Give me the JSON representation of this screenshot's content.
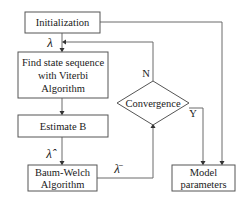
{
  "diagram": {
    "nodes": {
      "initialization": {
        "label": "Initialization"
      },
      "find_state": {
        "lines": [
          "Find state sequence",
          "with Viterbi",
          "Algorithm"
        ]
      },
      "estimate_b": {
        "label": "Estimate B"
      },
      "baum_welch": {
        "lines": [
          "Baum-Welch",
          "Algorithm"
        ]
      },
      "convergence": {
        "label": "Convergence"
      },
      "model_parameters": {
        "lines": [
          "Model",
          "parameters"
        ]
      }
    },
    "edge_labels": {
      "lambda": "λ",
      "lambda_hat": "λ̂",
      "lambda_bar": "λ̄",
      "no": "N",
      "yes": "Y"
    },
    "edges": [
      {
        "from": "initialization",
        "to": "find_state",
        "label": "λ"
      },
      {
        "from": "find_state",
        "to": "estimate_b"
      },
      {
        "from": "estimate_b",
        "to": "baum_welch",
        "label": "λ̂"
      },
      {
        "from": "baum_welch",
        "to": "convergence",
        "label": "λ̄"
      },
      {
        "from": "convergence",
        "to": "find_state",
        "label": "N"
      },
      {
        "from": "convergence",
        "to": "model_parameters",
        "label": "Y"
      },
      {
        "from": "initialization",
        "to": "model_parameters"
      }
    ]
  }
}
